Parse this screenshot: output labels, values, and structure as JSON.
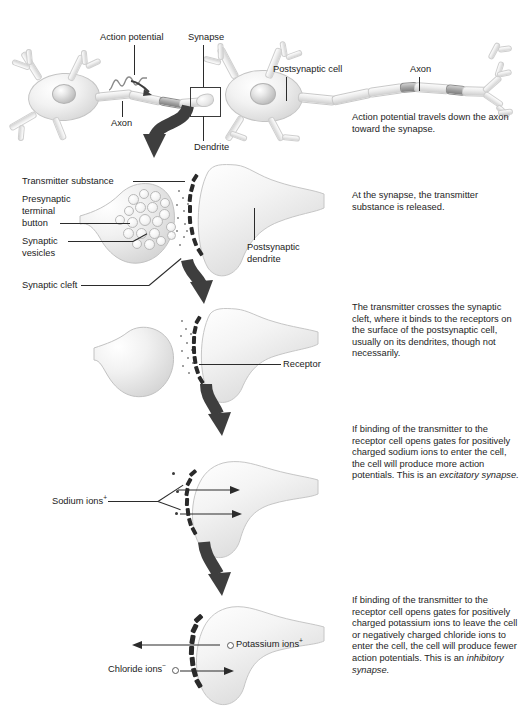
{
  "figure": {
    "type": "biology-diagram",
    "panel_count": 5
  },
  "panels": [
    {
      "id": "panel-1-neurons",
      "caption": "Action potential travels down the axon toward the synapse.",
      "labels": [
        {
          "name": "action-potential",
          "text": "Action potential"
        },
        {
          "name": "synapse",
          "text": "Synapse"
        },
        {
          "name": "postsynaptic-cell",
          "text": "Postsynaptic cell"
        },
        {
          "name": "axon-right",
          "text": "Axon"
        },
        {
          "name": "axon-left",
          "text": "Axon"
        },
        {
          "name": "dendrite",
          "text": "Dendrite"
        }
      ]
    },
    {
      "id": "panel-2-release",
      "caption": "At the synapse, the transmitter substance is released.",
      "labels": [
        {
          "name": "transmitter-substance",
          "text": "Transmitter substance"
        },
        {
          "name": "presynaptic-terminal-button",
          "text": "Presynaptic terminal button"
        },
        {
          "name": "presynaptic-terminal-button-line1",
          "text": "Presynaptic"
        },
        {
          "name": "presynaptic-terminal-button-line2",
          "text": "terminal"
        },
        {
          "name": "presynaptic-terminal-button-line3",
          "text": "button"
        },
        {
          "name": "synaptic-vesicles-line1",
          "text": "Synaptic"
        },
        {
          "name": "synaptic-vesicles-line2",
          "text": "vesicles"
        },
        {
          "name": "synaptic-cleft",
          "text": "Synaptic cleft"
        },
        {
          "name": "postsynaptic-dendrite-line1",
          "text": "Postsynaptic"
        },
        {
          "name": "postsynaptic-dendrite-line2",
          "text": "dendrite"
        }
      ]
    },
    {
      "id": "panel-3-binding",
      "caption": "The transmitter crosses the synaptic cleft, where it binds to the receptors on the surface of the postsynaptic cell, usually on its dendrites, though not necessarily.",
      "labels": [
        {
          "name": "receptor",
          "text": "Receptor"
        }
      ]
    },
    {
      "id": "panel-4-excitatory",
      "caption_before_italic": "If binding of the transmitter to the receptor cell opens gates for positively charged sodium ions to enter the cell, the cell will produce more action potentials. This is an ",
      "caption_italic": "excitatory synapse.",
      "labels": [
        {
          "name": "sodium-ions",
          "text": "Sodium ions",
          "charge": "+"
        }
      ]
    },
    {
      "id": "panel-5-inhibitory",
      "caption_before_italic": "If binding of the transmitter to the receptor cell opens gates for positively charged potassium ions to leave the cell or negatively charged chloride ions to enter the cell, the cell will produce fewer action potentials. This is an ",
      "caption_italic": "inhibitory synapse.",
      "labels": [
        {
          "name": "potassium-ions",
          "text": "Potassium ions",
          "charge": "+"
        },
        {
          "name": "chloride-ions",
          "text": "Chloride ions",
          "charge": "−"
        }
      ]
    }
  ],
  "colors": {
    "ink": "#1b1b1b",
    "line": "#2b2b2b",
    "arrow_dark": "#3a3a3a",
    "cell_fill": "#efefef",
    "cell_stroke": "#c6c6c6",
    "receptor_dark": "#2a2a2a",
    "background": "#ffffff"
  }
}
